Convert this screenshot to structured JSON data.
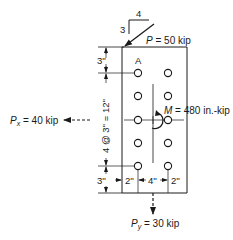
{
  "diagram": {
    "type": "bolted-connection-eccentric-load",
    "slope": {
      "horizontal": "4",
      "vertical": "3"
    },
    "loads": {
      "P": {
        "symbol": "P",
        "text": " = 50 kip"
      },
      "Px": {
        "symbol": "P",
        "sub": "x",
        "text": " = 40 kip"
      },
      "Py": {
        "symbol": "P",
        "sub": "y",
        "text": " = 30 kip"
      },
      "M": {
        "symbol": "M",
        "text": " = 480 in.-kip"
      }
    },
    "bolt_label": "A",
    "dimensions": {
      "top_edge": "3''",
      "vertical_spacing": "4 @ 3'' = 12''",
      "bottom_edge": "3''",
      "left_edge": "2''",
      "gauge": "4''",
      "right_edge": "2''"
    },
    "bolts": {
      "columns": 2,
      "rows": 5,
      "count": 10
    },
    "colors": {
      "line": "#1a1a1a",
      "background": "#ffffff"
    }
  }
}
